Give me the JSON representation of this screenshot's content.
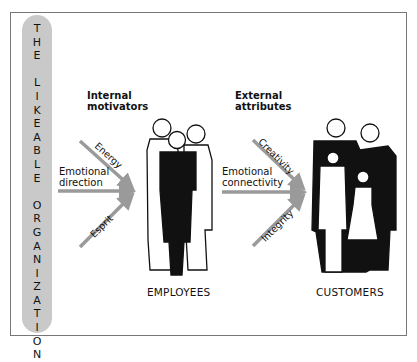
{
  "diagram": {
    "sidebar_title": "THE LIKEABLE ORGANIZATION",
    "sidebar_letters": [
      "T",
      "H",
      "E",
      "",
      "L",
      "I",
      "K",
      "E",
      "A",
      "B",
      "L",
      "E",
      "",
      "O",
      "R",
      "G",
      "A",
      "N",
      "I",
      "Z",
      "A",
      "T",
      "I",
      "O",
      "N"
    ],
    "internal": {
      "heading_line1": "Internal",
      "heading_line2": "motivators",
      "arrows": {
        "top": "Energy",
        "middle_line1": "Emotional",
        "middle_line2": "direction",
        "bottom": "Esprit"
      }
    },
    "employees_label": "EMPLOYEES",
    "external": {
      "heading_line1": "External",
      "heading_line2": "attributes",
      "arrows": {
        "top": "Creativity",
        "middle_line1": "Emotional",
        "middle_line2": "connectivity",
        "bottom": "Integrity"
      }
    },
    "customers_label": "CUSTOMERS",
    "colors": {
      "arrow": "#9a9a9a",
      "pill": "#c9c9c9",
      "figure_dark": "#111111"
    }
  }
}
